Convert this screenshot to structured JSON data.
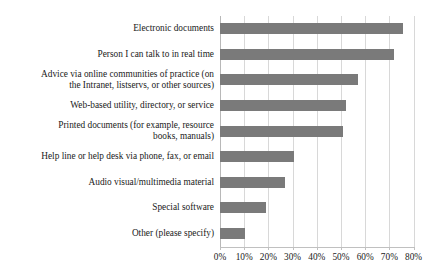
{
  "chart_data": {
    "type": "bar",
    "orientation": "horizontal",
    "title": "",
    "subtitle": "",
    "xlabel": "",
    "ylabel": "",
    "xlim": [
      0,
      80
    ],
    "xtick_labels": [
      "0%",
      "10%",
      "20%",
      "30%",
      "40%",
      "50%",
      "60%",
      "70%",
      "80%"
    ],
    "xticks": [
      0,
      10,
      20,
      30,
      40,
      50,
      60,
      70,
      80
    ],
    "grid": true,
    "legend": "none",
    "bar_color": "#7a7a7a",
    "grid_color": "#d8d8d8",
    "axis_color": "#c0c0c0",
    "text_color": "#1a1a1a",
    "categories": [
      "Electronic documents",
      "Person I can talk to in real time",
      "Advice via online communities of practice (on the Intranet, listservs, or other sources)",
      "Web-based utility, directory, or service",
      "Printed documents (for example, resource books, manuals)",
      "Help line or help desk via phone, fax, or email",
      "Audio visual/multimedia material",
      "Special software",
      "Other (please specify)"
    ],
    "category_lines": [
      [
        "Electronic documents"
      ],
      [
        "Person I can talk to in real time"
      ],
      [
        "Advice via online communities of practice (on",
        "the Intranet, listservs, or other sources)"
      ],
      [
        "Web-based utility, directory, or service"
      ],
      [
        "Printed documents (for example, resource",
        "books, manuals)"
      ],
      [
        "Help line or help desk via phone, fax, or email"
      ],
      [
        "Audio visual/multimedia material"
      ],
      [
        "Special software"
      ],
      [
        "Other (please specify)"
      ]
    ],
    "values": [
      75.5,
      72,
      57,
      52,
      51,
      30.5,
      27,
      19,
      10.5
    ]
  }
}
